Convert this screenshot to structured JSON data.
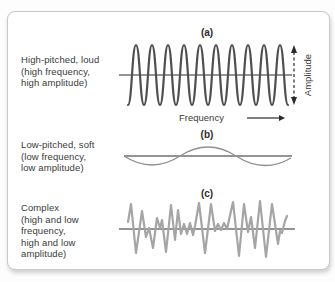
{
  "labels": {
    "frequency": "Frequency",
    "amplitude": "Amplitude"
  },
  "colors": {
    "wave_a": "#4f4f4f",
    "wave_b": "#8f8f8f",
    "wave_c": "#a5a5a5",
    "axis": "#2a2a2a",
    "arrow": "#2a2a2a",
    "panel_border": "#c9c9c9",
    "text": "#3a3a3a"
  },
  "sections": {
    "a": {
      "caption": "(a)",
      "label_lines": [
        "High-pitched, loud",
        "(high frequency,",
        "high amplitude)"
      ],
      "wave": {
        "type": "sine",
        "x_start": 120,
        "x_end": 280,
        "center_y": 63,
        "amplitude": 30,
        "cycles": 10
      }
    },
    "b": {
      "caption": "(b)",
      "label_lines": [
        "Low-pitched, soft",
        "(low frequency,",
        "low amplitude)"
      ],
      "wave": {
        "type": "sine-quads",
        "quads": [
          [
            116,
            144
          ],
          [
            144,
            162
          ],
          [
            172,
            144
          ],
          [
            200,
            126
          ],
          [
            228,
            144
          ],
          [
            256,
            162
          ],
          [
            283,
            146
          ]
        ]
      }
    },
    "c": {
      "caption": "(c)",
      "label_lines": [
        "Complex",
        "(high and low",
        "frequency,",
        "high and low",
        "amplitude)"
      ],
      "wave": {
        "type": "complex-polyline",
        "points": [
          [
            120,
            210
          ],
          [
            123,
            192
          ],
          [
            128,
            241
          ],
          [
            134,
            199
          ],
          [
            138,
            225
          ],
          [
            141,
            216
          ],
          [
            145,
            236
          ],
          [
            149,
            206
          ],
          [
            152,
            216
          ],
          [
            154,
            208
          ],
          [
            158,
            240
          ],
          [
            163,
            193
          ],
          [
            167,
            228
          ],
          [
            170,
            198
          ],
          [
            173,
            222
          ],
          [
            176,
            212
          ],
          [
            179,
            222
          ],
          [
            182,
            211
          ],
          [
            185,
            223
          ],
          [
            187,
            214
          ],
          [
            191,
            191
          ],
          [
            197,
            241
          ],
          [
            203,
            192
          ],
          [
            207,
            219
          ],
          [
            210,
            212
          ],
          [
            213,
            218
          ],
          [
            216,
            211
          ],
          [
            219,
            217
          ],
          [
            225,
            190
          ],
          [
            231,
            244
          ],
          [
            236,
            192
          ],
          [
            240,
            220
          ],
          [
            243,
            205
          ],
          [
            247,
            236
          ],
          [
            252,
            189
          ],
          [
            258,
            245
          ],
          [
            264,
            192
          ],
          [
            270,
            232
          ],
          [
            272,
            219
          ],
          [
            274,
            221
          ],
          [
            277,
            209
          ],
          [
            279,
            204
          ]
        ]
      }
    }
  }
}
